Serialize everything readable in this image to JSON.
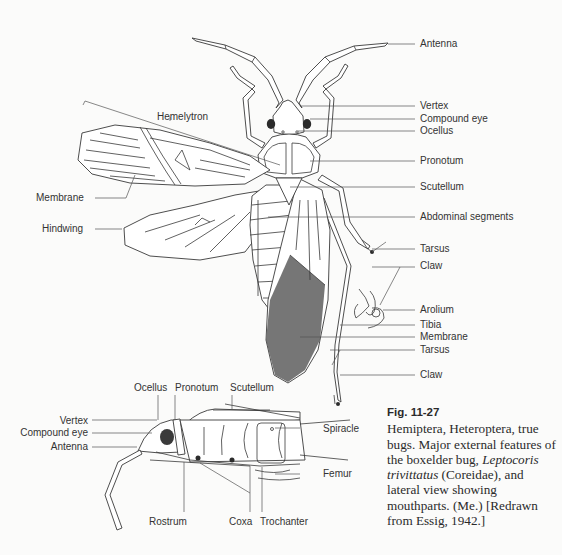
{
  "figure": {
    "number": "Fig. 11-27",
    "caption_parts": [
      {
        "text": "Hemiptera, Heteroptera, true bugs. Major external features of the boxelder bug, ",
        "italic": false
      },
      {
        "text": "Leptocoris trivittatus",
        "italic": true
      },
      {
        "text": " (Coreidae), and lateral view showing mouthparts. (Me.) [Redrawn from Essig, 1942.]",
        "italic": false
      }
    ]
  },
  "dorsal_view": {
    "right_labels": [
      "Antenna",
      "Vertex",
      "Compound eye",
      "Ocellus",
      "Pronotum",
      "Scutellum",
      "Abdominal segments",
      "Tarsus",
      "Claw",
      "Arolium",
      "Tibia",
      "Membrane",
      "Tarsus",
      "Claw"
    ],
    "left_labels": [
      "Hemelytron",
      "Membrane",
      "Hindwing"
    ]
  },
  "lateral_view": {
    "top_labels": [
      "Ocellus",
      "Pronotum",
      "Scutellum"
    ],
    "left_labels": [
      "Vertex",
      "Compound eye",
      "Antenna"
    ],
    "right_labels": [
      "Spiracle",
      "Femur"
    ],
    "bottom_labels": [
      "Rostrum",
      "Coxa",
      "Trochanter"
    ]
  }
}
